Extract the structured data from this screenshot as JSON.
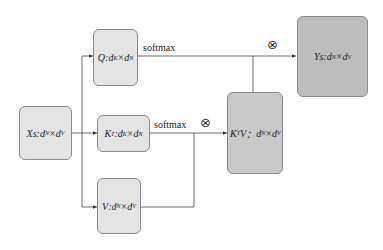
{
  "diagram": {
    "nodes": {
      "xs": {
        "var": "Xs",
        "dim1": "d",
        "sub1": "N",
        "dim2": "d",
        "sub2": "V"
      },
      "q": {
        "var": "Q",
        "dim1": "d",
        "sub1": "K",
        "dim2": "d",
        "sub2": "N"
      },
      "kt": {
        "var": "K",
        "sup": "T",
        "dim1": "d",
        "sub1": "K",
        "dim2": "d",
        "sub2": "N"
      },
      "v": {
        "var": "V",
        "dim1": "d",
        "sub1": "N",
        "dim2": "d",
        "sub2": "V"
      },
      "ktv": {
        "var": "K",
        "sup": "T",
        "var2": "V",
        "dim1": "d",
        "sub1": "N",
        "dim2": "d",
        "sub2": "V"
      },
      "ys": {
        "var": "Ys",
        "dim1": "d",
        "sub1": "N",
        "dim2": "d",
        "sub2": "V"
      }
    },
    "labels": {
      "softmax_top": "softmax",
      "softmax_mid": "softmax",
      "otimes_top": "⊗",
      "otimes_mid": "⊗",
      "sep": ":",
      "times": "×",
      "sep_wide": "： "
    }
  }
}
